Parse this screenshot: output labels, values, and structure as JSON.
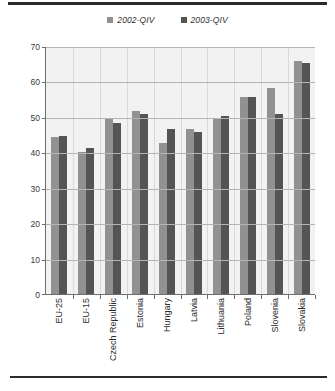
{
  "chart_data": {
    "type": "bar",
    "title": "",
    "subtitle": "",
    "xlabel": "",
    "ylabel": "",
    "ylim": [
      0,
      70
    ],
    "yticks": [
      0,
      10,
      20,
      30,
      40,
      50,
      60,
      70
    ],
    "ytick_labels": [
      "0",
      "10",
      "20",
      "30",
      "40",
      "50",
      "60",
      "70"
    ],
    "grid": "horizontal-and-vertical",
    "legend_position": "top-center",
    "categories": [
      "EU-25",
      "EU-15",
      "Czech Republic",
      "Estonia",
      "Hungary",
      "Latvia",
      "Lithuania",
      "Poland",
      "Slovenia",
      "Slovakia"
    ],
    "series": [
      {
        "name": "2002-QIV",
        "color": "#919191",
        "values": [
          44.5,
          40.5,
          50.0,
          52.0,
          43.0,
          47.0,
          50.0,
          56.0,
          58.5,
          66.0
        ]
      },
      {
        "name": "2003-QIV",
        "color": "#545454",
        "values": [
          45.0,
          41.5,
          48.5,
          51.0,
          47.0,
          46.0,
          50.5,
          56.0,
          51.0,
          65.5
        ]
      }
    ]
  },
  "legend": {
    "items": [
      {
        "label": "2002-QIV",
        "color": "#919191"
      },
      {
        "label": "2003-QIV",
        "color": "#545454"
      }
    ]
  },
  "colors": {
    "series_2002": "#919191",
    "series_2003": "#545454",
    "plot_background": "#f2f2f2",
    "gridline": "#b4b4b4",
    "axis": "#6e6e6e",
    "rule": "#2b2b2b"
  }
}
